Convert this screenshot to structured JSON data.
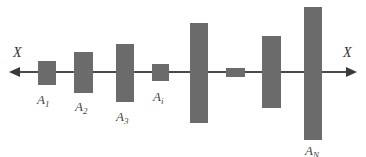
{
  "diagram": {
    "axis": {
      "left_label": "X",
      "right_label": "X",
      "line_color": "#4a4a4a",
      "direction": "bidirectional"
    },
    "block_color": "#6b6b6b",
    "blocks": [
      {
        "id": "A1",
        "label_main": "A",
        "label_sub": "1",
        "x": 38,
        "y": 61,
        "w": 18,
        "h": 24,
        "labelled": true,
        "label_x": 37,
        "label_y": 93
      },
      {
        "id": "A2",
        "label_main": "A",
        "label_sub": "2",
        "x": 74,
        "y": 52,
        "w": 19,
        "h": 41,
        "labelled": true,
        "label_x": 75,
        "label_y": 100
      },
      {
        "id": "A3",
        "label_main": "A",
        "label_sub": "3",
        "x": 116,
        "y": 44,
        "w": 18,
        "h": 58,
        "labelled": true,
        "label_x": 116,
        "label_y": 110
      },
      {
        "id": "Ai",
        "label_main": "A",
        "label_sub": "i",
        "x": 152,
        "y": 64,
        "w": 17,
        "h": 17,
        "labelled": true,
        "label_x": 153,
        "label_y": 90
      },
      {
        "id": "B5",
        "label_main": "",
        "label_sub": "",
        "x": 190,
        "y": 23,
        "w": 18,
        "h": 100,
        "labelled": false
      },
      {
        "id": "B6",
        "label_main": "",
        "label_sub": "",
        "x": 226,
        "y": 68,
        "w": 19,
        "h": 9,
        "labelled": false
      },
      {
        "id": "B7",
        "label_main": "",
        "label_sub": "",
        "x": 262,
        "y": 36,
        "w": 19,
        "h": 72,
        "labelled": false
      },
      {
        "id": "AN",
        "label_main": "A",
        "label_sub": "N",
        "x": 304,
        "y": 7,
        "w": 18,
        "h": 133,
        "labelled": true,
        "label_x": 305,
        "label_y": 144
      }
    ]
  }
}
